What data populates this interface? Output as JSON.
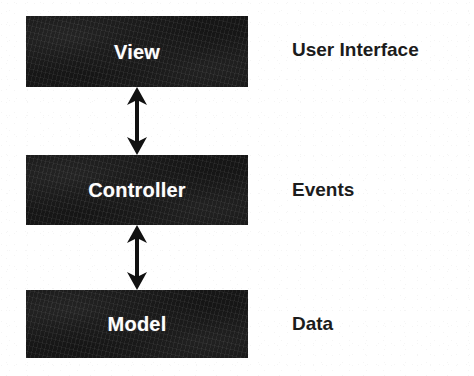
{
  "diagram": {
    "type": "block-diagram",
    "background_color": "#ffffff",
    "box_fill_color": "#161616",
    "box_text_color": "#fdfdfd",
    "label_text_color": "#1c1c1c",
    "nodes": [
      {
        "id": "view",
        "label": "View",
        "annotation": "User Interface"
      },
      {
        "id": "controller",
        "label": "Controller",
        "annotation": "Events"
      },
      {
        "id": "model",
        "label": "Model",
        "annotation": "Data"
      }
    ],
    "connectors": [
      {
        "id": "view-controller",
        "from": "view",
        "to": "controller",
        "style": "double-headed-arrow"
      },
      {
        "id": "controller-model",
        "from": "controller",
        "to": "model",
        "style": "double-headed-arrow"
      }
    ]
  }
}
